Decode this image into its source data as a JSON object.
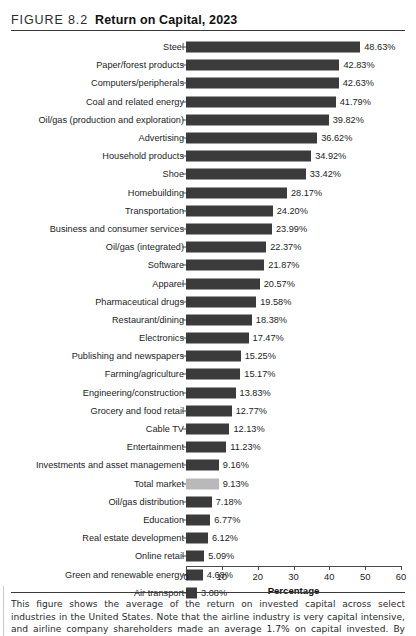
{
  "figure": {
    "label": "FIGURE 8.2",
    "title": "Return on Capital, 2023"
  },
  "caption": {
    "text": "This figure shows the average of the return on invested capital across select industries in the United States. Note that the airline industry is very capital intensive, and airline company shareholders made an average 1.7% on capital invested. By contrast, the shoe industry, while"
  },
  "colors": {
    "bar": "#3b3b3b",
    "bar_highlight": "#b9b9b9",
    "axis": "#4a4a4a",
    "text": "#1d1d1d",
    "rule": "#3a3a3a"
  },
  "chart_data": {
    "type": "bar",
    "orientation": "horizontal",
    "title": "Return on Capital, 2023",
    "xlabel": "Percentage",
    "ylabel": "",
    "xlim": [
      0,
      60
    ],
    "xticks": [
      0,
      10,
      20,
      30,
      40,
      50,
      60
    ],
    "grid": false,
    "legend": "none",
    "value_suffix": "%",
    "highlight_category": "Total market",
    "categories": [
      "Steel",
      "Paper/forest products",
      "Computers/peripherals",
      "Coal and related energy",
      "Oil/gas (production and exploration)",
      "Advertising",
      "Household products",
      "Shoe",
      "Homebuilding",
      "Transportation",
      "Business and consumer services",
      "Oil/gas (integrated)",
      "Software",
      "Apparel",
      "Pharmaceutical drugs",
      "Restaurant/dining",
      "Electronics",
      "Publishing and newspapers",
      "Farming/agriculture",
      "Engineering/construction",
      "Grocery and food retail",
      "Cable TV",
      "Entertainment",
      "Investments and asset management",
      "Total market",
      "Oil/gas distribution",
      "Education",
      "Real estate development",
      "Online retail",
      "Green and renewable energy",
      "Air transport"
    ],
    "values": [
      48.63,
      42.83,
      42.63,
      41.79,
      39.82,
      36.62,
      34.92,
      33.42,
      28.17,
      24.2,
      23.99,
      22.37,
      21.87,
      20.57,
      19.58,
      18.38,
      17.47,
      15.25,
      15.17,
      13.83,
      12.77,
      12.13,
      11.23,
      9.16,
      9.13,
      7.18,
      6.77,
      6.12,
      5.09,
      4.68,
      3.08
    ],
    "value_labels": [
      "48.63%",
      "42.83%",
      "42.63%",
      "41.79%",
      "39.82%",
      "36.62%",
      "34.92%",
      "33.42%",
      "28.17%",
      "24.20%",
      "23.99%",
      "22.37%",
      "21.87%",
      "20.57%",
      "19.58%",
      "18.38%",
      "17.47%",
      "15.25%",
      "15.17%",
      "13.83%",
      "12.77%",
      "12.13%",
      "11.23%",
      "9.16%",
      "9.13%",
      "7.18%",
      "6.77%",
      "6.12%",
      "5.09%",
      "4.68%",
      "3.08%"
    ]
  }
}
